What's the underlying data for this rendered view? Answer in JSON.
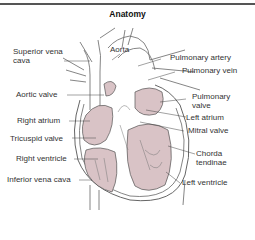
{
  "title": "Anatomy",
  "labels": {
    "superior_vena_cava_1": "Superior vena",
    "superior_vena_cava_2": "cava",
    "aorta": "Aorta",
    "pulmonary_artery": "Pulmonary artery",
    "pulmonary_vein": "Pulmonary vein",
    "aortic_valve": "Aortic valve",
    "pulmonary_valve_1": "Pulmonary",
    "pulmonary_valve_2": "valve",
    "left_atrium": "Left atrium",
    "right_atrium": "Right atrium",
    "mitral_valve": "Mitral valve",
    "tricuspid_valve": "Tricuspid valve",
    "chorda_tendinae_1": "Chorda",
    "chorda_tendinae_2": "tendinae",
    "right_ventricle": "Right ventricle",
    "inferior_vena_cava": "Inferior vena cava",
    "left_ventricle": "Left ventricle"
  },
  "colors": {
    "chamber_fill": "#d9c3c6",
    "line": "#555555",
    "rule": "#555555"
  }
}
